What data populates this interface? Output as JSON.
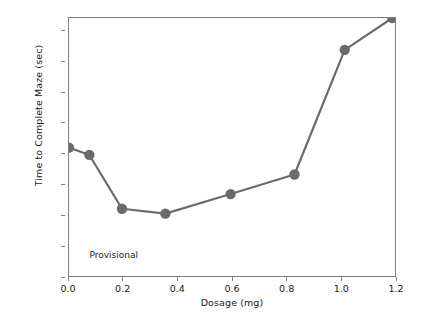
{
  "chart_data": {
    "type": "line",
    "title": "",
    "xlabel": "Dosage (mg)",
    "ylabel": "Time to Complete Maze (sec)",
    "xlim": [
      0.0,
      1.2
    ],
    "ylim": [
      0,
      211
    ],
    "grid": false,
    "legend": null,
    "marker": "circle",
    "line_color": "#6b6b6b",
    "marker_color": "#6b6b6b",
    "x": [
      0.0,
      0.075,
      0.195,
      0.355,
      0.595,
      0.83,
      1.015,
      1.19
    ],
    "values": [
      105,
      99,
      55,
      51,
      67,
      83,
      185,
      211
    ],
    "points": [
      {
        "x": 0.0,
        "y": 105
      },
      {
        "x": 0.075,
        "y": 99
      },
      {
        "x": 0.195,
        "y": 55
      },
      {
        "x": 0.355,
        "y": 51
      },
      {
        "x": 0.595,
        "y": 67
      },
      {
        "x": 0.83,
        "y": 83
      },
      {
        "x": 1.015,
        "y": 185
      },
      {
        "x": 1.19,
        "y": 211
      }
    ],
    "xticks": [
      {
        "value": 0.0,
        "label": "0.0"
      },
      {
        "value": 0.2,
        "label": "0.2"
      },
      {
        "value": 0.4,
        "label": "0.4"
      },
      {
        "value": 0.6,
        "label": "0.6"
      },
      {
        "value": 0.8,
        "label": "0.8"
      },
      {
        "value": 1.0,
        "label": "1.0"
      },
      {
        "value": 1.2,
        "label": "1.2"
      }
    ],
    "yticks": [
      {
        "value": 0,
        "label": "0"
      },
      {
        "value": 25,
        "label": "25"
      },
      {
        "value": 50,
        "label": "50"
      },
      {
        "value": 75,
        "label": "75"
      },
      {
        "value": 100,
        "label": "100"
      },
      {
        "value": 125,
        "label": "125"
      },
      {
        "value": 150,
        "label": "150"
      },
      {
        "value": 175,
        "label": "175"
      },
      {
        "value": 200,
        "label": "200"
      }
    ],
    "annotations": [
      {
        "text": "Provisional",
        "x": 0.075,
        "y": 18
      }
    ]
  }
}
